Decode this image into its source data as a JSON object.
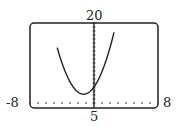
{
  "chart_data": {
    "type": "line",
    "title": "",
    "xlabel": "",
    "ylabel": "",
    "window": {
      "xmin_label": "-8",
      "xmax_label": "8",
      "ymax_label": "20",
      "ymin_label": "5"
    },
    "xlim": [
      -8,
      8
    ],
    "ylim": [
      0,
      20
    ],
    "grid": false,
    "axes": {
      "x_axis_style": "dotted",
      "y_axis_style": "tick-marked"
    },
    "series": [
      {
        "name": "parabola",
        "description": "upward-opening parabola, vertex near (-1.3, 2.2)",
        "x": [
          -4.5,
          -4,
          -3,
          -2,
          -1.3,
          -1,
          0,
          1,
          2,
          2.4
        ],
        "y": [
          19.2,
          10.0,
          5.3,
          2.7,
          2.2,
          2.3,
          4.0,
          7.9,
          14.2,
          17.0
        ]
      }
    ]
  }
}
